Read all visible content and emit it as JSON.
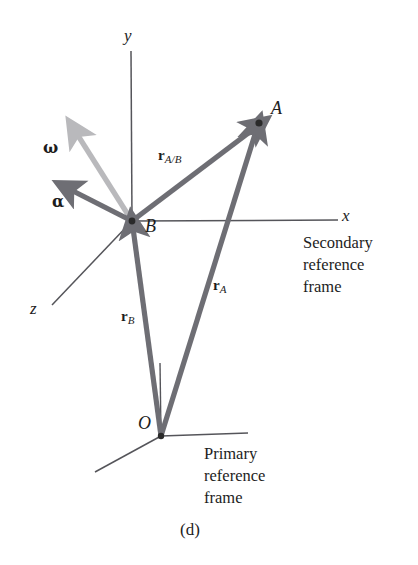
{
  "figure": {
    "caption": "(d)",
    "background_color": "#ffffff",
    "ink_color": "#1d1d1d"
  },
  "colors": {
    "axis": "#55555a",
    "vector_dark": "#6e6e74",
    "vector_light": "#b9b9bc",
    "point": "#2a2a2a",
    "text": "#1d1d1d"
  },
  "secondary_frame": {
    "origin_label": "B",
    "axes": [
      {
        "name": "y-axis",
        "label": "y"
      },
      {
        "name": "x-axis",
        "label": "x"
      },
      {
        "name": "z-axis",
        "label": "z"
      }
    ],
    "caption_lines": [
      "Secondary",
      "reference",
      "frame"
    ]
  },
  "primary_frame": {
    "origin_label": "O",
    "caption_lines": [
      "Primary",
      "reference",
      "frame"
    ]
  },
  "points": [
    {
      "name": "point-a",
      "label": "A",
      "x": 259,
      "y": 123
    },
    {
      "name": "point-b",
      "label": "B",
      "x": 132,
      "y": 221
    },
    {
      "name": "point-o",
      "label": "O",
      "x": 161,
      "y": 436
    }
  ],
  "vectors": [
    {
      "name": "r-a-over-b",
      "symbol": "r",
      "subscript": "A/B",
      "from": "B",
      "to": "A",
      "color": "#6e6e74"
    },
    {
      "name": "r-a",
      "symbol": "r",
      "subscript": "A",
      "from": "O",
      "to": "A",
      "color": "#6e6e74"
    },
    {
      "name": "r-b",
      "symbol": "r",
      "subscript": "B",
      "from": "O",
      "to": "B",
      "color": "#6e6e74"
    },
    {
      "name": "omega",
      "symbol": "ω",
      "subscript": "",
      "from": "B",
      "to": "upper-left",
      "color": "#b9b9bc"
    },
    {
      "name": "alpha",
      "symbol": "α",
      "subscript": "",
      "from": "B",
      "to": "left",
      "color": "#6e6e74"
    }
  ],
  "labels": {
    "axis_y": "y",
    "axis_x": "x",
    "axis_z": "z",
    "point_a": "A",
    "point_b": "B",
    "point_o": "O",
    "omega": "ω",
    "alpha": "α",
    "r_bold": "r",
    "sub_a_over_b": "A/B",
    "sub_a": "A",
    "sub_b": "B",
    "secondary_line1": "Secondary",
    "secondary_line2": "reference",
    "secondary_line3": "frame",
    "primary_line1": "Primary",
    "primary_line2": "reference",
    "primary_line3": "frame",
    "caption": "(d)"
  }
}
